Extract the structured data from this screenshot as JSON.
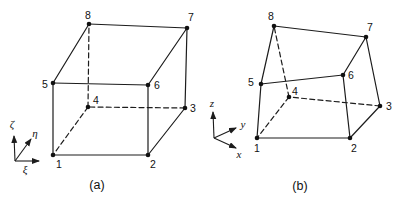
{
  "canvas": {
    "width": 403,
    "height": 201,
    "background": "#ffffff",
    "line_color": "#1c1c1c",
    "text_color": "#111111"
  },
  "figure_type": "hexahedral-element-diagrams",
  "diagrams": [
    {
      "id": "a",
      "caption": "(a)",
      "caption_pos": {
        "x": 97,
        "y": 189
      },
      "nodes": [
        {
          "label": "1",
          "x": 53,
          "y": 155,
          "lx": 59,
          "ly": 168
        },
        {
          "label": "2",
          "x": 148,
          "y": 155,
          "lx": 153,
          "ly": 168
        },
        {
          "label": "3",
          "x": 185,
          "y": 108,
          "lx": 193,
          "ly": 112
        },
        {
          "label": "4",
          "x": 88,
          "y": 107,
          "lx": 96,
          "ly": 104
        },
        {
          "label": "5",
          "x": 53,
          "y": 83,
          "lx": 45,
          "ly": 88
        },
        {
          "label": "6",
          "x": 148,
          "y": 85,
          "lx": 157,
          "ly": 89
        },
        {
          "label": "7",
          "x": 187,
          "y": 28,
          "lx": 191,
          "ly": 21
        },
        {
          "label": "8",
          "x": 89,
          "y": 24,
          "lx": 88,
          "ly": 19
        }
      ],
      "edges": [
        {
          "from": "1",
          "to": "2",
          "style": "solid"
        },
        {
          "from": "2",
          "to": "3",
          "style": "solid"
        },
        {
          "from": "3",
          "to": "4",
          "style": "dashed"
        },
        {
          "from": "4",
          "to": "1",
          "style": "dashed"
        },
        {
          "from": "5",
          "to": "6",
          "style": "solid"
        },
        {
          "from": "6",
          "to": "7",
          "style": "solid"
        },
        {
          "from": "7",
          "to": "8",
          "style": "solid"
        },
        {
          "from": "8",
          "to": "5",
          "style": "solid"
        },
        {
          "from": "1",
          "to": "5",
          "style": "solid"
        },
        {
          "from": "2",
          "to": "6",
          "style": "solid"
        },
        {
          "from": "3",
          "to": "7",
          "style": "solid"
        },
        {
          "from": "4",
          "to": "8",
          "style": "dashed"
        }
      ],
      "axes": {
        "origin": {
          "x": 15,
          "y": 161
        },
        "arrows": [
          {
            "label": "ζ",
            "name": "zeta-axis",
            "tip_x": 14,
            "tip_y": 136,
            "lx": 12,
            "ly": 128
          },
          {
            "label": "η",
            "name": "eta-axis",
            "tip_x": 31,
            "tip_y": 139,
            "lx": 35,
            "ly": 137
          },
          {
            "label": "ξ",
            "name": "xi-axis",
            "tip_x": 39,
            "tip_y": 161,
            "lx": 25,
            "ly": 173
          }
        ]
      }
    },
    {
      "id": "b",
      "caption": "(b)",
      "caption_pos": {
        "x": 300,
        "y": 190
      },
      "nodes": [
        {
          "label": "1",
          "x": 257,
          "y": 138,
          "lx": 257,
          "ly": 152
        },
        {
          "label": "2",
          "x": 350,
          "y": 138,
          "lx": 354,
          "ly": 152
        },
        {
          "label": "3",
          "x": 380,
          "y": 106,
          "lx": 389,
          "ly": 110
        },
        {
          "label": "4",
          "x": 289,
          "y": 97,
          "lx": 295,
          "ly": 95
        },
        {
          "label": "5",
          "x": 261,
          "y": 84,
          "lx": 251,
          "ly": 86
        },
        {
          "label": "6",
          "x": 343,
          "y": 75,
          "lx": 351,
          "ly": 79
        },
        {
          "label": "7",
          "x": 366,
          "y": 37,
          "lx": 370,
          "ly": 31
        },
        {
          "label": "8",
          "x": 274,
          "y": 26,
          "lx": 271,
          "ly": 20
        }
      ],
      "edges": [
        {
          "from": "1",
          "to": "2",
          "style": "solid"
        },
        {
          "from": "2",
          "to": "3",
          "style": "solid"
        },
        {
          "from": "3",
          "to": "4",
          "style": "dashed"
        },
        {
          "from": "4",
          "to": "1",
          "style": "dashed"
        },
        {
          "from": "5",
          "to": "6",
          "style": "solid"
        },
        {
          "from": "6",
          "to": "7",
          "style": "solid"
        },
        {
          "from": "7",
          "to": "8",
          "style": "solid"
        },
        {
          "from": "8",
          "to": "5",
          "style": "solid"
        },
        {
          "from": "1",
          "to": "5",
          "style": "solid"
        },
        {
          "from": "2",
          "to": "6",
          "style": "solid"
        },
        {
          "from": "3",
          "to": "7",
          "style": "solid"
        },
        {
          "from": "4",
          "to": "8",
          "style": "dashed"
        }
      ],
      "axes": {
        "origin": {
          "x": 214,
          "y": 138
        },
        "arrows": [
          {
            "label": "z",
            "name": "z-axis",
            "tip_x": 213,
            "tip_y": 112,
            "lx": 212,
            "ly": 107
          },
          {
            "label": "y",
            "name": "y-axis",
            "tip_x": 236,
            "tip_y": 128,
            "lx": 243,
            "ly": 128
          },
          {
            "label": "x",
            "name": "x-axis",
            "tip_x": 236,
            "tip_y": 148,
            "lx": 239,
            "ly": 158
          }
        ]
      }
    }
  ]
}
